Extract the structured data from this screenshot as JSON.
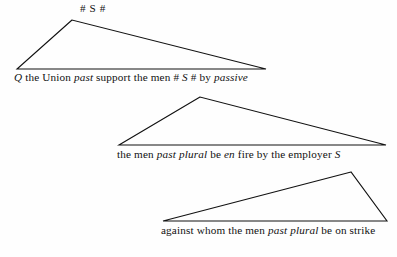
{
  "diagram": {
    "type": "syntax-derivation-triangles",
    "background_color": "#fefefe",
    "line_color": "#111111",
    "triangles": [
      {
        "name": "triangle-1",
        "apex": [
          72,
          20
        ],
        "base_left": [
          17,
          69
        ],
        "base_right": [
          266,
          69
        ],
        "label": "# S #"
      },
      {
        "name": "triangle-2",
        "apex": [
          200,
          97
        ],
        "base_left": [
          119,
          145
        ],
        "base_right": [
          386,
          145
        ],
        "label": ""
      },
      {
        "name": "triangle-3",
        "apex": [
          351,
          172
        ],
        "base_left": [
          163,
          221
        ],
        "base_right": [
          387,
          221
        ],
        "label": ""
      }
    ],
    "labels": {
      "top_node": "# S #"
    },
    "lines": [
      {
        "name": "derivation-line-1",
        "x": 14,
        "y": 71,
        "segments": [
          {
            "text": "Q",
            "italic": true
          },
          {
            "text": " the Union ",
            "italic": false
          },
          {
            "text": "past",
            "italic": true
          },
          {
            "text": " support the men ",
            "italic": false
          },
          {
            "text": "#",
            "italic": false
          },
          {
            "text": " S ",
            "italic": true
          },
          {
            "text": "#",
            "italic": false
          },
          {
            "text": "  by ",
            "italic": false
          },
          {
            "text": "passive",
            "italic": true
          }
        ]
      },
      {
        "name": "derivation-line-2",
        "x": 117,
        "y": 148,
        "segments": [
          {
            "text": "the men ",
            "italic": false
          },
          {
            "text": "past plural",
            "italic": true
          },
          {
            "text": " be ",
            "italic": false
          },
          {
            "text": "en",
            "italic": true
          },
          {
            "text": " fire by the employer ",
            "italic": false
          },
          {
            "text": "S",
            "italic": true
          }
        ]
      },
      {
        "name": "derivation-line-3",
        "x": 161,
        "y": 224,
        "segments": [
          {
            "text": "against whom the men ",
            "italic": false
          },
          {
            "text": "past plural",
            "italic": true
          },
          {
            "text": " be on strike",
            "italic": false
          }
        ]
      }
    ]
  }
}
